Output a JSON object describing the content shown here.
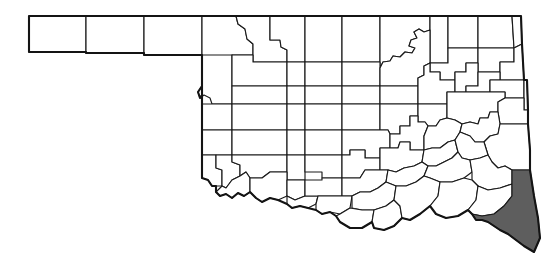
{
  "figure": {
    "type": "choropleth-distribution-map",
    "region_name": "Oklahoma",
    "subdivision_type": "county",
    "subdivision_count": 77,
    "background_color": "#ffffff",
    "outline_color": "#1a1a1a",
    "fill_color_default": "#ffffff",
    "fill_color_highlighted": "#5e5e5e",
    "title": "",
    "caption": "",
    "legend": []
  },
  "highlight": {
    "count": 1,
    "names": [
      "McCurtain"
    ],
    "position": "southeast corner",
    "fill": "#5e5e5e"
  },
  "map_data": {
    "type": "map",
    "projection": "equirectangular-approx",
    "viewbox": "0 0 547 271",
    "panhandle_counties": [
      "Cimarron",
      "Texas",
      "Beaver"
    ],
    "counties": [
      {
        "name": "Cimarron",
        "highlighted": false
      },
      {
        "name": "Texas",
        "highlighted": false
      },
      {
        "name": "Beaver",
        "highlighted": false
      },
      {
        "name": "Harper",
        "highlighted": false
      },
      {
        "name": "Woods",
        "highlighted": false
      },
      {
        "name": "Alfalfa",
        "highlighted": false
      },
      {
        "name": "Grant",
        "highlighted": false
      },
      {
        "name": "Kay",
        "highlighted": false
      },
      {
        "name": "Osage",
        "highlighted": false
      },
      {
        "name": "Washington",
        "highlighted": false
      },
      {
        "name": "Nowata",
        "highlighted": false
      },
      {
        "name": "Craig",
        "highlighted": false
      },
      {
        "name": "Ottawa",
        "highlighted": false
      },
      {
        "name": "Ellis",
        "highlighted": false
      },
      {
        "name": "Woodward",
        "highlighted": false
      },
      {
        "name": "Major",
        "highlighted": false
      },
      {
        "name": "Garfield",
        "highlighted": false
      },
      {
        "name": "Noble",
        "highlighted": false
      },
      {
        "name": "Pawnee",
        "highlighted": false
      },
      {
        "name": "Tulsa",
        "highlighted": false
      },
      {
        "name": "Rogers",
        "highlighted": false
      },
      {
        "name": "Mayes",
        "highlighted": false
      },
      {
        "name": "Delaware",
        "highlighted": false
      },
      {
        "name": "Roger Mills",
        "highlighted": false
      },
      {
        "name": "Dewey",
        "highlighted": false
      },
      {
        "name": "Blaine",
        "highlighted": false
      },
      {
        "name": "Kingfisher",
        "highlighted": false
      },
      {
        "name": "Logan",
        "highlighted": false
      },
      {
        "name": "Payne",
        "highlighted": false
      },
      {
        "name": "Creek",
        "highlighted": false
      },
      {
        "name": "Wagoner",
        "highlighted": false
      },
      {
        "name": "Cherokee",
        "highlighted": false
      },
      {
        "name": "Adair",
        "highlighted": false
      },
      {
        "name": "Muskogee",
        "highlighted": false
      },
      {
        "name": "Okmulgee",
        "highlighted": false
      },
      {
        "name": "Okfuskee",
        "highlighted": false
      },
      {
        "name": "Lincoln",
        "highlighted": false
      },
      {
        "name": "Oklahoma",
        "highlighted": false
      },
      {
        "name": "Canadian",
        "highlighted": false
      },
      {
        "name": "Custer",
        "highlighted": false
      },
      {
        "name": "Beckham",
        "highlighted": false
      },
      {
        "name": "Washita",
        "highlighted": false
      },
      {
        "name": "Caddo",
        "highlighted": false
      },
      {
        "name": "Grady",
        "highlighted": false
      },
      {
        "name": "Cleveland",
        "highlighted": false
      },
      {
        "name": "Pottawatomie",
        "highlighted": false
      },
      {
        "name": "Seminole",
        "highlighted": false
      },
      {
        "name": "Hughes",
        "highlighted": false
      },
      {
        "name": "McIntosh",
        "highlighted": false
      },
      {
        "name": "Sequoyah",
        "highlighted": false
      },
      {
        "name": "Haskell",
        "highlighted": false
      },
      {
        "name": "Pittsburg",
        "highlighted": false
      },
      {
        "name": "Latimer",
        "highlighted": false
      },
      {
        "name": "Le Flore",
        "highlighted": false
      },
      {
        "name": "Greer",
        "highlighted": false
      },
      {
        "name": "Harmon",
        "highlighted": false
      },
      {
        "name": "Kiowa",
        "highlighted": false
      },
      {
        "name": "Jackson",
        "highlighted": false
      },
      {
        "name": "Tillman",
        "highlighted": false
      },
      {
        "name": "Comanche",
        "highlighted": false
      },
      {
        "name": "Cotton",
        "highlighted": false
      },
      {
        "name": "Stephens",
        "highlighted": false
      },
      {
        "name": "Jefferson",
        "highlighted": false
      },
      {
        "name": "Garvin",
        "highlighted": false
      },
      {
        "name": "Murray",
        "highlighted": false
      },
      {
        "name": "Carter",
        "highlighted": false
      },
      {
        "name": "Love",
        "highlighted": false
      },
      {
        "name": "Marshall",
        "highlighted": false
      },
      {
        "name": "Johnston",
        "highlighted": false
      },
      {
        "name": "Pontotoc",
        "highlighted": false
      },
      {
        "name": "Coal",
        "highlighted": false
      },
      {
        "name": "Atoka",
        "highlighted": false
      },
      {
        "name": "Bryan",
        "highlighted": false
      },
      {
        "name": "Choctaw",
        "highlighted": false
      },
      {
        "name": "Pushmataha",
        "highlighted": false
      },
      {
        "name": "McCurtain",
        "highlighted": true
      },
      {
        "name": "Osage-north",
        "highlighted": false
      }
    ]
  }
}
